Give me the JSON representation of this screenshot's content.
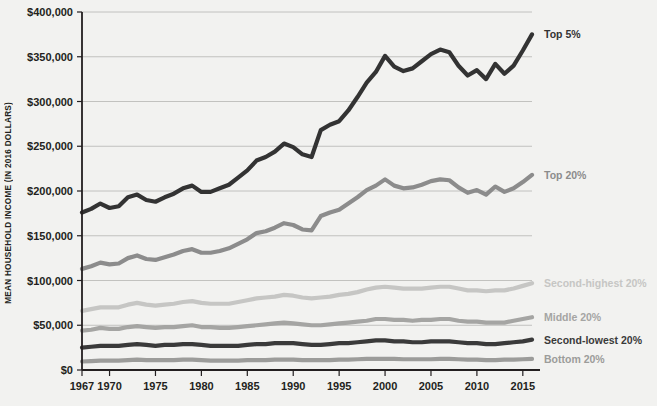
{
  "chart_data": {
    "type": "line",
    "title": "",
    "xlabel": "",
    "ylabel": "MEAN HOUSEHOLD INCOME (IN 2016 DOLLARS)",
    "xlim": [
      1967,
      2016
    ],
    "ylim": [
      0,
      400000
    ],
    "grid": "horizontal",
    "legend_position": "right-inline",
    "y_ticks": [
      0,
      50000,
      100000,
      150000,
      200000,
      250000,
      300000,
      350000,
      400000
    ],
    "y_tick_labels": [
      "$0",
      "$50,000",
      "$100,000",
      "$150,000",
      "$200,000",
      "$250,000",
      "$300,000",
      "$350,000",
      "$400,000"
    ],
    "x_ticks": [
      1967,
      1970,
      1975,
      1980,
      1985,
      1990,
      1995,
      2000,
      2005,
      2010,
      2015
    ],
    "x_tick_labels": [
      "1967",
      "1970",
      "1975",
      "1980",
      "1985",
      "1990",
      "1995",
      "2000",
      "2005",
      "2010",
      "2015"
    ],
    "x": [
      1967,
      1968,
      1969,
      1970,
      1971,
      1972,
      1973,
      1974,
      1975,
      1976,
      1977,
      1978,
      1979,
      1980,
      1981,
      1982,
      1983,
      1984,
      1985,
      1986,
      1987,
      1988,
      1989,
      1990,
      1991,
      1992,
      1993,
      1994,
      1995,
      1996,
      1997,
      1998,
      1999,
      2000,
      2001,
      2002,
      2003,
      2004,
      2005,
      2006,
      2007,
      2008,
      2009,
      2010,
      2011,
      2012,
      2013,
      2014,
      2015,
      2016
    ],
    "series": [
      {
        "name": "Top 5%",
        "label": "Top 5%",
        "color": "#333333",
        "values": [
          176000,
          180000,
          186000,
          181000,
          183000,
          193000,
          196000,
          190000,
          188000,
          193000,
          197000,
          203000,
          206000,
          199000,
          199000,
          203000,
          207000,
          215000,
          223000,
          234000,
          238000,
          244000,
          253000,
          249000,
          241000,
          238000,
          268000,
          274000,
          278000,
          290000,
          305000,
          321000,
          333000,
          351000,
          339000,
          334000,
          337000,
          345000,
          353000,
          358000,
          355000,
          340000,
          329000,
          335000,
          325000,
          342000,
          331000,
          340000,
          357000,
          375000
        ]
      },
      {
        "name": "Top 20%",
        "label": "Top 20%",
        "color": "#8c8c8c",
        "values": [
          113000,
          116000,
          120000,
          118000,
          119000,
          125000,
          128000,
          124000,
          123000,
          126000,
          129000,
          133000,
          135000,
          131000,
          131000,
          133000,
          136000,
          141000,
          146000,
          153000,
          155000,
          159000,
          164000,
          162000,
          157000,
          156000,
          172000,
          176000,
          179000,
          186000,
          193000,
          201000,
          206000,
          213000,
          206000,
          203000,
          204000,
          207000,
          211000,
          213000,
          212000,
          204000,
          198000,
          201000,
          196000,
          205000,
          199000,
          203000,
          210000,
          218000
        ]
      },
      {
        "name": "Second-highest 20%",
        "label": "Second-highest 20%",
        "color": "#c6c6c4",
        "values": [
          66000,
          68000,
          70000,
          70000,
          70000,
          73000,
          75000,
          73000,
          72000,
          73000,
          74000,
          76000,
          77000,
          75000,
          74000,
          74000,
          74000,
          76000,
          78000,
          80000,
          81000,
          82000,
          84000,
          83000,
          81000,
          80000,
          81000,
          82000,
          84000,
          85000,
          87000,
          90000,
          92000,
          93000,
          92000,
          91000,
          91000,
          91000,
          92000,
          93000,
          93000,
          91000,
          89000,
          89000,
          88000,
          89000,
          89000,
          91000,
          94000,
          97000
        ]
      },
      {
        "name": "Middle 20%",
        "label": "Middle 20%",
        "color": "#a5a5a3",
        "values": [
          44000,
          45000,
          47000,
          46000,
          46000,
          48000,
          49000,
          48000,
          47000,
          48000,
          48000,
          49000,
          50000,
          48000,
          48000,
          47000,
          47000,
          48000,
          49000,
          50000,
          51000,
          52000,
          53000,
          52000,
          51000,
          50000,
          50000,
          51000,
          52000,
          53000,
          54000,
          55000,
          57000,
          57000,
          56000,
          56000,
          55000,
          56000,
          56000,
          57000,
          57000,
          55000,
          54000,
          54000,
          53000,
          53000,
          53000,
          55000,
          57000,
          59000
        ]
      },
      {
        "name": "Second-lowest 20%",
        "label": "Second-lowest 20%",
        "color": "#3a3a3a",
        "values": [
          25000,
          26000,
          27000,
          27000,
          27000,
          28000,
          29000,
          28000,
          27000,
          28000,
          28000,
          29000,
          29000,
          28000,
          27000,
          27000,
          27000,
          27000,
          28000,
          29000,
          29000,
          30000,
          30000,
          30000,
          29000,
          28000,
          28000,
          29000,
          30000,
          30000,
          31000,
          32000,
          33000,
          33000,
          32000,
          32000,
          31000,
          31000,
          32000,
          32000,
          32000,
          31000,
          30000,
          30000,
          29000,
          29000,
          30000,
          31000,
          32000,
          34000
        ]
      },
      {
        "name": "Bottom 20%",
        "label": "Bottom 20%",
        "color": "#9c9c9a",
        "values": [
          9500,
          10000,
          10500,
          10500,
          10500,
          11000,
          11500,
          11000,
          11000,
          11000,
          11000,
          11500,
          11500,
          11000,
          10500,
          10500,
          10500,
          10500,
          11000,
          11000,
          11000,
          11500,
          11500,
          11500,
          11000,
          11000,
          11000,
          11000,
          11500,
          11500,
          12000,
          12500,
          12500,
          12500,
          12500,
          12000,
          12000,
          12000,
          12000,
          12500,
          12500,
          12000,
          11500,
          11500,
          11000,
          11000,
          11500,
          11500,
          12000,
          12500
        ]
      }
    ]
  },
  "axis": {
    "y_title": "MEAN HOUSEHOLD INCOME (IN 2016 DOLLARS)"
  },
  "colors": {
    "background": "#f2f2f0",
    "axis": "#231f20",
    "grid": "#b5b5b3",
    "text": "#231f20"
  }
}
